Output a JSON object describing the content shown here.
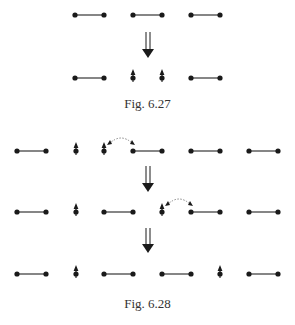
{
  "figures": [
    {
      "caption": "Fig. 6.27",
      "caption_y": 96,
      "rows": [
        {
          "y": 15,
          "items": [
            {
              "type": "dimer",
              "x1": 75,
              "x2": 104
            },
            {
              "type": "dimer",
              "x1": 133,
              "x2": 162
            },
            {
              "type": "dimer",
              "x1": 191,
              "x2": 220
            }
          ]
        },
        {
          "y": 78,
          "items": [
            {
              "type": "dimer",
              "x1": 75,
              "x2": 104
            },
            {
              "type": "spin",
              "x": 133
            },
            {
              "type": "spin",
              "x": 162
            },
            {
              "type": "dimer",
              "x1": 191,
              "x2": 220
            }
          ]
        }
      ],
      "arrows": [
        {
          "x": 148,
          "y1": 32,
          "y2": 58
        }
      ],
      "hops": []
    },
    {
      "caption": "Fig. 6.28",
      "caption_y": 296,
      "rows": [
        {
          "y": 151,
          "items": [
            {
              "type": "dimer",
              "x1": 17,
              "x2": 46
            },
            {
              "type": "spin",
              "x": 76
            },
            {
              "type": "spin",
              "x": 104
            },
            {
              "type": "dimer",
              "x1": 133,
              "x2": 162
            },
            {
              "type": "dimer",
              "x1": 191,
              "x2": 220
            },
            {
              "type": "dimer",
              "x1": 249,
              "x2": 278
            }
          ]
        },
        {
          "y": 212,
          "items": [
            {
              "type": "dimer",
              "x1": 17,
              "x2": 46
            },
            {
              "type": "spin",
              "x": 76
            },
            {
              "type": "dimer",
              "x1": 104,
              "x2": 133
            },
            {
              "type": "spin",
              "x": 162
            },
            {
              "type": "dimer",
              "x1": 191,
              "x2": 220
            },
            {
              "type": "dimer",
              "x1": 249,
              "x2": 278
            }
          ]
        },
        {
          "y": 274,
          "items": [
            {
              "type": "dimer",
              "x1": 17,
              "x2": 46
            },
            {
              "type": "spin",
              "x": 76
            },
            {
              "type": "dimer",
              "x1": 104,
              "x2": 133
            },
            {
              "type": "dimer",
              "x1": 162,
              "x2": 191
            },
            {
              "type": "spin",
              "x": 220
            },
            {
              "type": "dimer",
              "x1": 249,
              "x2": 278
            }
          ]
        }
      ],
      "arrows": [
        {
          "x": 148,
          "y1": 166,
          "y2": 192
        },
        {
          "x": 148,
          "y1": 228,
          "y2": 253
        }
      ],
      "hops": [
        {
          "x1": 109,
          "x2": 133,
          "y": 139
        },
        {
          "x1": 167,
          "x2": 191,
          "y": 200
        }
      ]
    }
  ],
  "style": {
    "ink": "#1a1a1a",
    "line": "#444444",
    "dash": "#888888"
  }
}
